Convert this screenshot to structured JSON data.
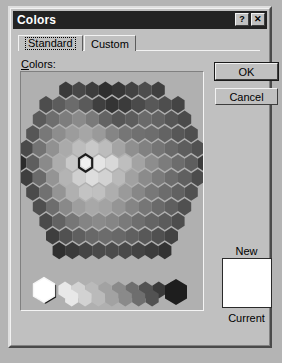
{
  "window": {
    "title": "Colors",
    "titlebar_bg": "#232323",
    "titlebar_fg": "#ffffff",
    "face_color": "#c0c0c0",
    "buttons": [
      {
        "name": "help-button",
        "glyph": "?"
      },
      {
        "name": "close-button",
        "glyph": "✕"
      }
    ]
  },
  "tabs": [
    {
      "label": "Standard",
      "selected": true
    },
    {
      "label": "Custom",
      "selected": false
    }
  ],
  "labels": {
    "colors": "Colors:",
    "colors_accel": "C",
    "colors_rest": "olors:",
    "new": "New",
    "current": "Current"
  },
  "actions": {
    "ok": "OK",
    "cancel": "Cancel"
  },
  "preview": {
    "new_color": "#ffffff",
    "current_color": "#ffffff"
  },
  "palette": {
    "note": "Grayscale-rendered hexagonal Standard color honeycomb",
    "selected_hex_index": 63,
    "selected_gray_index": 0,
    "panel_bg": "#b0b0b0",
    "selection_outline": "#1c1c1c",
    "selection_highlight": "#f4f4f4",
    "hex_rows": [
      {
        "count": 8,
        "grays": [
          "#3a3a3a",
          "#474747",
          "#3d3d3d",
          "#2f2f2f",
          "#363636",
          "#424242",
          "#4d4d4d",
          "#3f3f3f"
        ]
      },
      {
        "count": 11,
        "grays": [
          "#4d4d4d",
          "#5c5c5c",
          "#6b6b6b",
          "#5a5a5a",
          "#3f3f3f",
          "#343434",
          "#3b3b3b",
          "#4a4a4a",
          "#585858",
          "#4e4e4e",
          "#444444"
        ]
      },
      {
        "count": 12,
        "grays": [
          "#5a5a5a",
          "#6e6e6e",
          "#7d7d7d",
          "#8a8a8a",
          "#7a7a7a",
          "#636363",
          "#555555",
          "#5d5d5d",
          "#6a6a6a",
          "#636363",
          "#565656",
          "#4b4b4b"
        ]
      },
      {
        "count": 13,
        "grays": [
          "#565656",
          "#787878",
          "#8d8d8d",
          "#9c9c9c",
          "#a6a6a6",
          "#9a9a9a",
          "#858585",
          "#767676",
          "#707070",
          "#6d6d6d",
          "#636363",
          "#575757",
          "#4f4f4f"
        ]
      },
      {
        "count": 14,
        "grays": [
          "#4a4a4a",
          "#737373",
          "#919191",
          "#aaaaaa",
          "#bdbdbd",
          "#c8c8c8",
          "#bcbcbc",
          "#a4a4a4",
          "#8f8f8f",
          "#818181",
          "#757575",
          "#696969",
          "#5d5d5d",
          "#515151"
        ]
      },
      {
        "count": 15,
        "grays": [
          "#2b2b2b",
          "#5e5e5e",
          "#8a8a8a",
          "#adadad",
          "#c9c9c9",
          "#dcdcdc",
          "#e4e4e4",
          "#d8d8d8",
          "#bebebe",
          "#a3a3a3",
          "#8d8d8d",
          "#7c7c7c",
          "#6c6c6c",
          "#5e5e5e",
          "#3c3c3c"
        ]
      },
      {
        "count": 14,
        "grays": [
          "#3f3f3f",
          "#6a6a6a",
          "#949494",
          "#b4b4b4",
          "#cfcfcf",
          "#dddddd",
          "#d2d2d2",
          "#bababa",
          "#a1a1a1",
          "#8b8b8b",
          "#7b7b7b",
          "#6d6d6d",
          "#606060",
          "#4c4c4c"
        ]
      },
      {
        "count": 13,
        "grays": [
          "#4b4b4b",
          "#717171",
          "#949494",
          "#b0b0b0",
          "#c3c3c3",
          "#c0c0c0",
          "#aeaeae",
          "#9a9a9a",
          "#878787",
          "#787878",
          "#6c6c6c",
          "#616161",
          "#515151"
        ]
      },
      {
        "count": 12,
        "grays": [
          "#4f4f4f",
          "#6d6d6d",
          "#898989",
          "#9e9e9e",
          "#a8a8a8",
          "#a3a3a3",
          "#959595",
          "#858585",
          "#767676",
          "#6a6a6a",
          "#5f5f5f",
          "#505050"
        ]
      },
      {
        "count": 11,
        "grays": [
          "#4a4a4a",
          "#626262",
          "#767676",
          "#848484",
          "#8a8a8a",
          "#858585",
          "#7a7a7a",
          "#6e6e6e",
          "#646464",
          "#5b5b5b",
          "#4d4d4d"
        ]
      },
      {
        "count": 10,
        "grays": [
          "#3e3e3e",
          "#515151",
          "#5f5f5f",
          "#686868",
          "#6c6c6c",
          "#686868",
          "#606060",
          "#585858",
          "#505050",
          "#434343"
        ]
      },
      {
        "count": 9,
        "grays": [
          "#2f2f2f",
          "#3a3a3a",
          "#444444",
          "#4a4a4a",
          "#4c4c4c",
          "#494949",
          "#434343",
          "#3c3c3c",
          "#333333"
        ]
      }
    ],
    "gray_ramp": [
      "#ffffff",
      "#e8e8e8",
      "#d2d2d2",
      "#bababa",
      "#a2a2a2",
      "#8a8a8a",
      "#6e6e6e",
      "#525252",
      "#3a3a3a",
      "#272727"
    ],
    "gray_ramp_black": "#1e1e1e"
  }
}
